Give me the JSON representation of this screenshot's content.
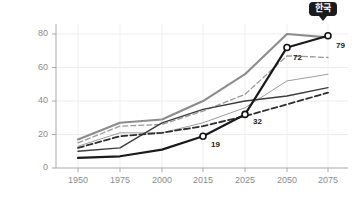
{
  "chart_data": {
    "type": "line",
    "title": "",
    "subtitle": "",
    "xlabel": "",
    "ylabel": "",
    "x": [
      1950,
      1975,
      2000,
      2015,
      2025,
      2050,
      2075
    ],
    "xticklabels": [
      "1950",
      "1975",
      "2000",
      "2015",
      "2025",
      "2050",
      "2075"
    ],
    "yticklabels": [
      "0",
      "20",
      "40",
      "60",
      "80"
    ],
    "yticks": [
      0,
      20,
      40,
      60,
      80
    ],
    "ylim": [
      0,
      86
    ],
    "xlim": [
      1950,
      2075
    ],
    "grid": "horizontal",
    "legend": "none",
    "annotations": [
      {
        "text": "한국",
        "x": 2075,
        "y": 79,
        "style": "dark-badge-callout"
      },
      {
        "text": "79",
        "x": 2075,
        "y": 79,
        "style": "point-label"
      },
      {
        "text": "72",
        "x": 2050,
        "y": 72,
        "style": "point-label"
      },
      {
        "text": "32",
        "x": 2025,
        "y": 32,
        "style": "point-label"
      },
      {
        "text": "19",
        "x": 2015,
        "y": 19,
        "style": "point-label"
      }
    ],
    "series": [
      {
        "name": "korea-highlight",
        "values": [
          6,
          7,
          11,
          19,
          32,
          72,
          79
        ],
        "color": "#1a1a1a",
        "width": 2.2,
        "dash": "none",
        "markers": [
          null,
          null,
          null,
          19,
          32,
          72,
          79
        ]
      },
      {
        "name": "gray-solid-top",
        "values": [
          17,
          27,
          29,
          40,
          56,
          80,
          78
        ],
        "color": "#8c8c8c",
        "width": 2.1,
        "dash": "none",
        "markers": []
      },
      {
        "name": "gray-dashed-upper",
        "values": [
          15,
          25,
          26,
          34,
          44,
          67,
          66
        ],
        "color": "#9a9a9a",
        "width": 1.3,
        "dash": "5,3",
        "markers": []
      },
      {
        "name": "thin-gray-solid",
        "values": [
          13,
          21,
          21,
          27,
          36,
          52,
          56
        ],
        "color": "#9e9e9e",
        "width": 1.0,
        "dash": "none",
        "markers": []
      },
      {
        "name": "dark-solid-flat",
        "values": [
          10,
          12,
          27,
          35,
          40,
          43,
          48
        ],
        "color": "#3b3b3b",
        "width": 1.4,
        "dash": "none",
        "markers": []
      },
      {
        "name": "dark-dashed",
        "values": [
          12,
          19,
          21,
          25,
          31,
          38,
          45
        ],
        "color": "#2e2e2e",
        "width": 1.8,
        "dash": "6,3",
        "markers": []
      }
    ]
  },
  "axes": {
    "y_axis_label": "value-axis",
    "x_axis_label": "year-axis"
  },
  "callout": {
    "label": "한국"
  },
  "point_labels": {
    "p2015": "19",
    "p2025": "32",
    "p2050": "72",
    "p2075": "79"
  }
}
